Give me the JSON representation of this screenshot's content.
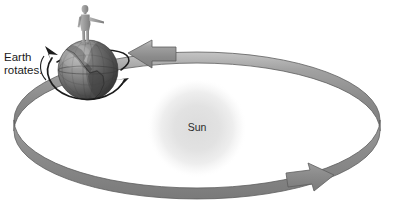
{
  "diagram": {
    "background_color": "#ffffff",
    "width": 393,
    "height": 207
  },
  "labels": {
    "earth_rotates_line1": "Earth",
    "earth_rotates_line2": "rotates.",
    "sun": "Sun"
  },
  "objects": {
    "sun": {
      "name": "Sun",
      "center_x": 197,
      "center_y": 128,
      "radius": 50,
      "color_core": "#e2e2e2",
      "color_edge": "#ffffff"
    },
    "earth": {
      "name": "Earth",
      "center_x": 88,
      "center_y": 70,
      "radius": 30,
      "color_light": "#a8a8a8",
      "color_dark": "#4a4a4a"
    },
    "person": {
      "name": "person-standing-on-earth",
      "x": 88,
      "y": 18,
      "color": "#9a9a9a"
    }
  },
  "orbit": {
    "name": "orbit-ribbon",
    "band_color": "#8d8d8d",
    "band_highlight": "#c9c9c9",
    "band_outline": "#5e5e5e",
    "center_x": 197,
    "center_y": 120,
    "radius_x": 183,
    "radius_y": 68,
    "arrowheads": [
      {
        "name": "orbit-arrow-top",
        "direction": "left",
        "x": 137,
        "y": 52
      },
      {
        "name": "orbit-arrow-bottom",
        "direction": "right",
        "x": 322,
        "y": 175
      }
    ]
  },
  "rotation_arrows": {
    "name": "earth-rotation-arrows",
    "color": "#1c1c1c",
    "direction": "counterclockwise-west-to-east",
    "arrowhead_upper_left": {
      "x": 52,
      "y": 52
    },
    "arrowhead_lower_right": {
      "x": 124,
      "y": 85
    }
  },
  "colors": {
    "background": "#ffffff",
    "text": "#1a1a1a",
    "orbit_band": "#8d8d8d",
    "sun_glow": "#e4e4e4",
    "earth_dark": "#4f4f4f"
  }
}
